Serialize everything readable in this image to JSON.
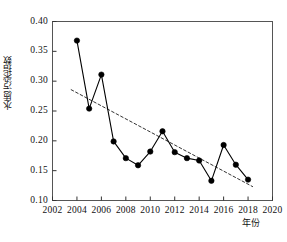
{
  "chart_data": {
    "type": "line",
    "title": "",
    "xlabel": "年份",
    "ylabel": "水质污染指数",
    "xlim": [
      2002,
      2020
    ],
    "ylim": [
      0.1,
      0.4
    ],
    "grid": false,
    "legend": "none",
    "xticks": [
      "2002",
      "2004",
      "2006",
      "2008",
      "2010",
      "2012",
      "2014",
      "2016",
      "2018",
      "2020"
    ],
    "xtick_values": [
      2002,
      2004,
      2006,
      2008,
      2010,
      2012,
      2014,
      2016,
      2018,
      2020
    ],
    "yticks": [
      "0.40",
      "0.35",
      "0.30",
      "0.25",
      "0.20",
      "0.15",
      "0.10"
    ],
    "ytick_values": [
      0.4,
      0.35,
      0.3,
      0.25,
      0.2,
      0.15,
      0.1
    ],
    "x": [
      2004,
      2005,
      2006,
      2007,
      2008,
      2009,
      2010,
      2011,
      2012,
      2013,
      2014,
      2015,
      2016,
      2017,
      2018
    ],
    "series": [
      {
        "name": "水质污染指数",
        "marker": "filled-circle",
        "color": "#000000",
        "values": [
          0.368,
          0.254,
          0.311,
          0.199,
          0.171,
          0.159,
          0.182,
          0.216,
          0.181,
          0.171,
          0.167,
          0.133,
          0.193,
          0.16,
          0.135
        ]
      },
      {
        "name": "线性趋势线",
        "style": "dashed",
        "color": "#333333",
        "x": [
          2003.5,
          2018.4
        ],
        "values": [
          0.286,
          0.123
        ]
      }
    ]
  },
  "axes": {
    "y_title": "水质污染指数",
    "x_title": "年份"
  },
  "caption": {
    "text": ""
  }
}
